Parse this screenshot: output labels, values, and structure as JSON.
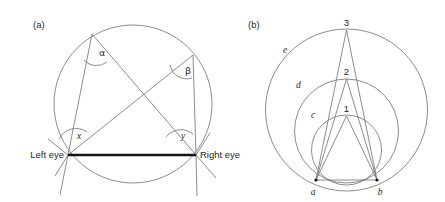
{
  "figure": {
    "background": "#ffffff",
    "stroke_thin": "#6e6e6e",
    "stroke_thick": "#141414",
    "width": 445,
    "height": 202
  },
  "panel_a": {
    "label": "(a)",
    "label_pos": {
      "x": 33,
      "y": 28
    },
    "circle": {
      "cx": 133,
      "cy": 104,
      "r": 79
    },
    "points": {
      "left_eye": {
        "x": 68,
        "y": 155,
        "label": "Left eye",
        "label_x": 64,
        "label_y": 158
      },
      "right_eye": {
        "x": 196,
        "y": 155,
        "label": "Right eye",
        "label_x": 200,
        "label_y": 158
      },
      "alpha_vertex": {
        "x": 92,
        "y": 34
      },
      "beta_vertex": {
        "x": 193,
        "y": 55
      }
    },
    "angles": [
      {
        "name": "alpha",
        "label": "α",
        "x": 99,
        "y": 56,
        "class": "greek"
      },
      {
        "name": "beta",
        "label": "β",
        "x": 185,
        "y": 74,
        "class": "greek"
      },
      {
        "name": "x",
        "label": "x",
        "x": 77,
        "y": 139,
        "class": "italic"
      },
      {
        "name": "y",
        "label": "y",
        "x": 181,
        "y": 139,
        "class": "italic"
      }
    ],
    "interocular_line": {
      "x1": 68,
      "y1": 155,
      "x2": 196,
      "y2": 155
    },
    "chords": [
      {
        "from": "alpha_vertex",
        "to": "left_eye"
      },
      {
        "from": "alpha_vertex",
        "to": "right_eye"
      },
      {
        "from": "beta_vertex",
        "to": "left_eye"
      },
      {
        "from": "beta_vertex",
        "to": "right_eye"
      }
    ]
  },
  "panel_b": {
    "label": "(b)",
    "label_pos": {
      "x": 248,
      "y": 28
    },
    "base": {
      "a": {
        "x": 316,
        "y": 180,
        "label": "a",
        "label_x": 313,
        "label_y": 194
      },
      "b": {
        "x": 377,
        "y": 180,
        "label": "b",
        "label_x": 379,
        "label_y": 194
      }
    },
    "circles": [
      {
        "name": "c",
        "label": "c",
        "cx": 346.5,
        "cy": 150,
        "r": 35,
        "label_x": 311,
        "label_y": 118
      },
      {
        "name": "d",
        "label": "d",
        "cx": 346.5,
        "cy": 131,
        "r": 52,
        "label_x": 296,
        "label_y": 88
      },
      {
        "name": "e",
        "label": "e",
        "cx": 346.5,
        "cy": 110,
        "r": 81,
        "label_x": 283,
        "label_y": 53
      }
    ],
    "apexes": [
      {
        "name": "1",
        "label": "1",
        "x": 346.5,
        "y": 116,
        "label_x": 343,
        "label_y": 112
      },
      {
        "name": "2",
        "label": "2",
        "x": 346.5,
        "y": 79,
        "label_x": 343,
        "label_y": 75
      },
      {
        "name": "3",
        "label": "3",
        "x": 346.5,
        "y": 30,
        "label_x": 343,
        "label_y": 26
      }
    ],
    "base_line": {
      "x1": 316,
      "y1": 180,
      "x2": 377,
      "y2": 180
    }
  }
}
